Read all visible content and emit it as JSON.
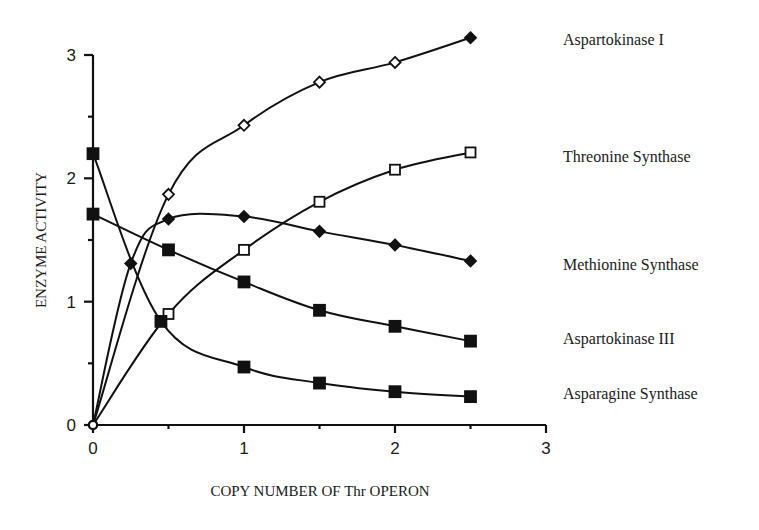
{
  "chart_data": {
    "type": "line",
    "title": "",
    "xlabel": "COPY NUMBER OF Thr OPERON",
    "ylabel": "ENZYME ACTIVITY",
    "xlim": [
      0,
      3
    ],
    "ylim": [
      0,
      3
    ],
    "xticks": [
      0,
      1,
      2,
      3
    ],
    "yticks": [
      0,
      1,
      2,
      3
    ],
    "grid": false,
    "legend_position": "right (labels at curve ends)",
    "series": [
      {
        "name": "Aspartokinase I",
        "marker": "open-diamond",
        "x": [
          0,
          0.5,
          1,
          1.5,
          2,
          2.5
        ],
        "values": [
          0,
          1.87,
          2.43,
          2.78,
          2.94,
          3.14
        ]
      },
      {
        "name": "Threonine Synthase",
        "marker": "open-square",
        "x": [
          0,
          0.5,
          1,
          1.5,
          2,
          2.5
        ],
        "values": [
          0,
          0.9,
          1.42,
          1.81,
          2.07,
          2.21
        ]
      },
      {
        "name": "Methionine Synthase",
        "marker": "filled-diamond",
        "x": [
          0,
          0.25,
          0.5,
          1,
          1.5,
          2,
          2.5
        ],
        "values": [
          0,
          1.31,
          1.67,
          1.69,
          1.57,
          1.46,
          1.33
        ]
      },
      {
        "name": "Aspartokinase III",
        "marker": "filled-square",
        "x": [
          0,
          0.5,
          1,
          1.5,
          2,
          2.5
        ],
        "values": [
          1.71,
          1.42,
          1.16,
          0.93,
          0.8,
          0.68
        ]
      },
      {
        "name": "Asparagine Synthase",
        "marker": "filled-square",
        "x": [
          0,
          0.45,
          1,
          1.5,
          2,
          2.5
        ],
        "values": [
          2.2,
          0.84,
          0.47,
          0.34,
          0.27,
          0.23
        ]
      }
    ]
  },
  "labels": {
    "xlabel": "COPY NUMBER OF Thr OPERON",
    "ylabel": "ENZYME ACTIVITY",
    "series_labels": [
      {
        "text": "Aspartokinase I",
        "y": 45
      },
      {
        "text": "Threonine Synthase",
        "y": 162
      },
      {
        "text": "Methionine Synthase",
        "y": 270
      },
      {
        "text": "Aspartokinase III",
        "y": 344
      },
      {
        "text": "Asparagine Synthase",
        "y": 399
      }
    ]
  }
}
